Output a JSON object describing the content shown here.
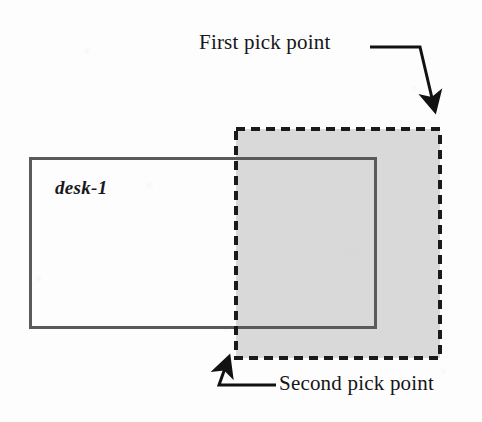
{
  "figure": {
    "background_color": "#fdfdfd"
  },
  "labels": {
    "first_pick": "First pick point",
    "second_pick": "Second pick point",
    "object_name": "desk-1"
  },
  "colors": {
    "object_outline": "#1a1a1a",
    "object_outline_selected": "#5a5a5a",
    "selection_window_border": "#1a1a1a",
    "selection_window_fill": "#d2d2d2",
    "leader_line": "#121212",
    "text": "#16161a"
  },
  "geometry": {
    "object_rect": {
      "name": "desk-1",
      "x": 29,
      "y": 157,
      "width": 348,
      "height": 172,
      "stroke_width": 6,
      "style": "solid"
    },
    "selection_window": {
      "name": "crossing-window",
      "x": 236,
      "y": 129,
      "width": 204,
      "height": 229,
      "stroke_width": 4,
      "style": "dashed",
      "dash_pattern": "9 6",
      "fill": "#d2d2d2",
      "fill_opacity": 0.85
    },
    "first_pick_point": {
      "x": 440,
      "y": 129
    },
    "second_pick_point": {
      "x": 236,
      "y": 358
    }
  },
  "leaders": [
    {
      "name": "first-pick-leader",
      "points": "370,47 420,47 436,114",
      "arrow_tip": {
        "x": 438,
        "y": 120
      },
      "arrow_angle": 76
    },
    {
      "name": "second-pick-leader",
      "points": "275,385 220,385 230,358",
      "arrow_tip": {
        "x": 232,
        "y": 351
      },
      "arrow_angle": -70
    }
  ]
}
